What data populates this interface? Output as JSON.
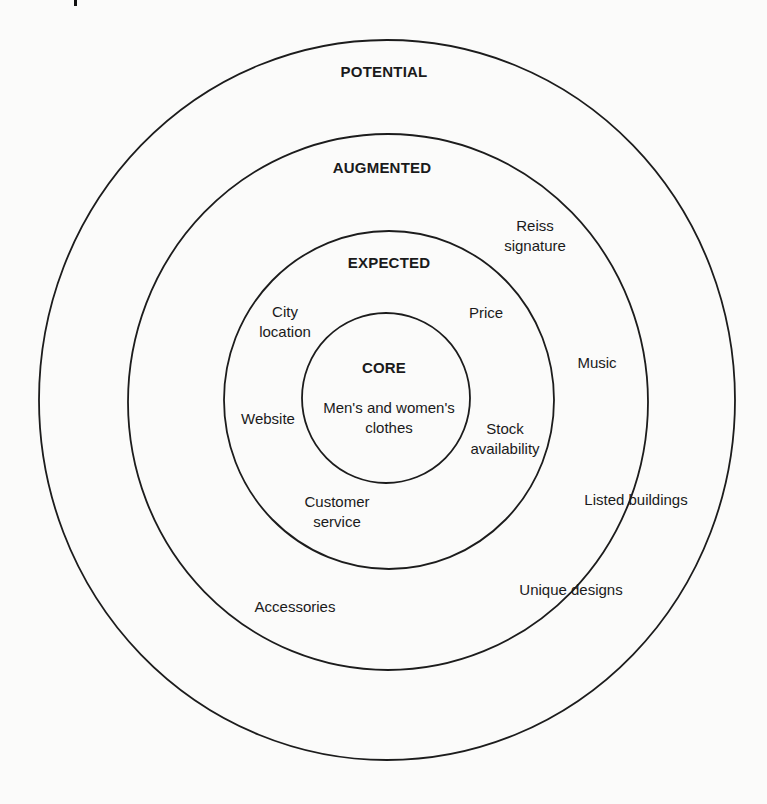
{
  "diagram": {
    "type": "concentric-product-levels",
    "layers": [
      {
        "id": "potential",
        "title": "POTENTIAL",
        "items": []
      },
      {
        "id": "augmented",
        "title": "AUGMENTED",
        "items": [
          "Reiss signature",
          "Music",
          "Listed buildings",
          "Unique designs",
          "Accessories"
        ]
      },
      {
        "id": "expected",
        "title": "EXPECTED",
        "items": [
          "City location",
          "Price",
          "Website",
          "Stock availability",
          "Customer service"
        ]
      },
      {
        "id": "core",
        "title": "CORE",
        "items": [
          "Men's and women's clothes"
        ]
      }
    ]
  },
  "labels": {
    "potential": "POTENTIAL",
    "augmented": "AUGMENTED",
    "expected": "EXPECTED",
    "core": "CORE",
    "core_item_line1": "Men's and women's",
    "core_item_line2": "clothes",
    "reiss_line1": "Reiss",
    "reiss_line2": "signature",
    "music": "Music",
    "listed_buildings": "Listed buildings",
    "unique_designs": "Unique designs",
    "accessories": "Accessories",
    "city_line1": "City",
    "city_line2": "location",
    "price": "Price",
    "website": "Website",
    "stock_line1": "Stock",
    "stock_line2": "availability",
    "customer_line1": "Customer",
    "customer_line2": "service"
  },
  "colors": {
    "background": "#fbfbfa",
    "stroke": "#1c1c1c",
    "text": "#1a1a1a"
  }
}
